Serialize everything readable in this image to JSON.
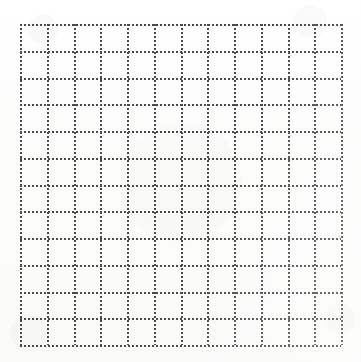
{
  "document": {
    "kind": "grid-paper-scan",
    "title": "Dotted Grid Paper",
    "description": "Scanned blank sheet of dotted grid / graph paper",
    "caption": "",
    "page_text": "",
    "labels": []
  },
  "canvas": {
    "width_px": 361,
    "height_px": 362,
    "background_color": "#fdfdfd",
    "paper_tint": "#fafaf9"
  },
  "grid": {
    "origin_x_px": 20,
    "origin_y_px": 24,
    "width_px": 321,
    "height_px": 321,
    "columns": 12,
    "rows": 12,
    "cell_size_px": 26.75,
    "vertical_line_count": 13,
    "horizontal_line_count": 13,
    "line_style": "dotted",
    "dot_size_px": 2,
    "dot_pitch_px": 4,
    "line_color": "#4a4a4a",
    "vertical_line_positions_px": [
      0,
      26.75,
      53.5,
      80.25,
      107,
      133.75,
      160.5,
      187.25,
      214,
      240.75,
      267.5,
      294.25,
      321
    ],
    "horizontal_line_positions_px": [
      0,
      26.75,
      53.5,
      80.25,
      107,
      133.75,
      160.5,
      187.25,
      214,
      240.75,
      267.5,
      294.25,
      321
    ]
  }
}
